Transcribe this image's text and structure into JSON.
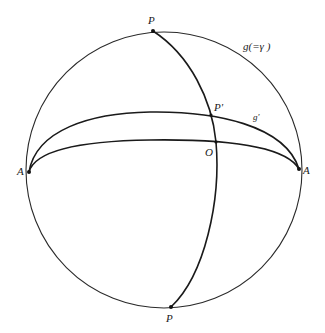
{
  "diagram": {
    "sphere": {
      "cx": 164,
      "cy": 170,
      "r": 138
    },
    "points": {
      "P_top": {
        "label": "P",
        "x": 153,
        "y": 31
      },
      "P_bottom": {
        "label": "P",
        "x": 171,
        "y": 307
      },
      "A_left": {
        "label": "A",
        "x": 29,
        "y": 172
      },
      "A_right": {
        "label": "A",
        "x": 299,
        "y": 169
      },
      "O": {
        "label": "O",
        "x": 216,
        "y": 142
      },
      "P_prime": {
        "label": "P'",
        "x": 211,
        "y": 115
      }
    },
    "curve_labels": {
      "g": "g(=γ )",
      "g_prime": "g'"
    }
  }
}
